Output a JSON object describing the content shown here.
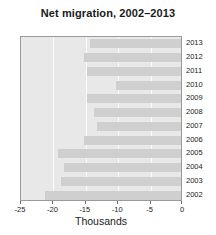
{
  "chart_data": {
    "type": "bar",
    "orientation": "horizontal",
    "title": "Net migration, 2002–2013",
    "xlabel": "Thousands",
    "ylabel": "",
    "categories": [
      "2013",
      "2012",
      "2011",
      "2010",
      "2009",
      "2008",
      "2007",
      "2006",
      "2005",
      "2004",
      "2003",
      "2002"
    ],
    "values": [
      -14,
      -15,
      -14.5,
      -10,
      -14.5,
      -13.5,
      -13,
      -15,
      -19,
      -18,
      -18.5,
      -21
    ],
    "xlim": [
      -25,
      0
    ],
    "xticks": [
      -25,
      -20,
      -15,
      -10,
      -5,
      0
    ],
    "xtick_labels": [
      "-25",
      "-20",
      "-15",
      "-10",
      "-5",
      "0"
    ],
    "grid": true,
    "legend": null,
    "bar_color": "#cfcfcf",
    "plot_background": "#e8e8e8",
    "gridline_color": "#fbfbfb"
  }
}
